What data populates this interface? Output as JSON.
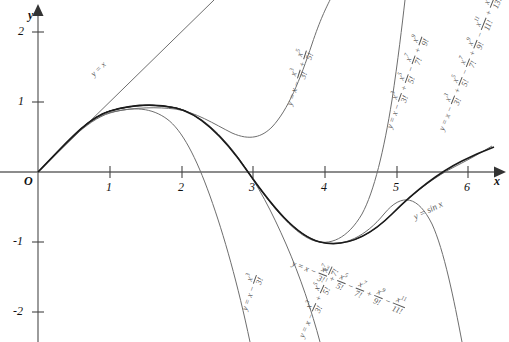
{
  "chart_data": {
    "type": "line",
    "title": "",
    "xlabel": "x",
    "ylabel": "y",
    "xlim": [
      -0.55,
      6.6
    ],
    "ylim": [
      -2.45,
      2.45
    ],
    "xticks": [
      1,
      2,
      3,
      4,
      5,
      6
    ],
    "yticks": [
      2,
      1,
      -1,
      -2
    ],
    "origin_label": "O",
    "grid": false,
    "legend": "inline-curve-labels",
    "series": [
      {
        "name": "y = sin x",
        "label": "y = sin x",
        "color": "#1a1a1a",
        "width": 1.6,
        "expression": "sin(x)",
        "points_x": [
          0,
          0.5,
          1,
          1.5708,
          2,
          2.5,
          3.1416,
          3.5,
          4,
          4.7124,
          5,
          5.5,
          6,
          6.5
        ],
        "points_y": [
          0,
          0.479,
          0.841,
          1,
          0.909,
          0.599,
          0,
          -0.351,
          -0.757,
          -1,
          -0.959,
          -0.706,
          -0.279,
          0.215
        ]
      },
      {
        "name": "T1",
        "label": "y = x",
        "color": "#6e6e6e",
        "width": 1,
        "expression": "x",
        "points_x": [
          0,
          1,
          2,
          2.45
        ],
        "points_y": [
          0,
          1,
          2,
          2.45
        ]
      },
      {
        "name": "T3",
        "label": "y = x - x^3/3!",
        "color": "#6e6e6e",
        "width": 1,
        "expression": "x - x^3/3!",
        "points_x": [
          0,
          0.5,
          1,
          1.5708,
          2,
          2.5,
          3,
          3.3
        ],
        "points_y": [
          0,
          0.479,
          0.833,
          0.925,
          0.667,
          -0.104,
          -1.5,
          -2.69
        ]
      },
      {
        "name": "T5",
        "label": "y = x - x^3/3! + x^5/5!",
        "color": "#6e6e6e",
        "width": 1,
        "expression": "x - x^3/3! + x^5/5!",
        "points_x": [
          0,
          1,
          1.5708,
          2,
          2.5,
          3,
          3.5,
          4,
          4.3
        ],
        "points_y": [
          0,
          0.842,
          1.004,
          0.933,
          0.71,
          0.525,
          1.063,
          3.06,
          5.0
        ]
      },
      {
        "name": "T7",
        "label": "y = x - x^3/3! + x^5/5! - x^7/7!",
        "color": "#6e6e6e",
        "width": 1,
        "expression": "x - x^3/3! + x^5/5! - x^7/7!",
        "points_x": [
          0,
          1,
          1.5708,
          2.5,
          3.1416,
          3.8,
          4.2,
          4.5
        ],
        "points_y": [
          0,
          0.841,
          1.0,
          0.598,
          -0.075,
          -1.2,
          -2.2,
          -3.3
        ]
      },
      {
        "name": "T9",
        "label": "y = x - x^3/3! + x^5/5! - x^7/7! + x^9/9!",
        "color": "#6e6e6e",
        "width": 1,
        "expression": "x - x^3/3! + x^5/5! - x^7/7! + x^9/9!",
        "points_x": [
          0,
          1.5708,
          3.1416,
          4,
          4.7124,
          5,
          5.3
        ],
        "points_y": [
          0,
          1.0,
          0.0,
          -0.757,
          -0.976,
          -0.8,
          0.2
        ]
      },
      {
        "name": "T11",
        "label": "y = x - x^3/3! + x^5/5! - x^7/7! + x^9/9! - x^11/11!",
        "color": "#6e6e6e",
        "width": 1,
        "expression": "x - x^3/3! + x^5/5! - x^7/7! + x^9/9! - x^11/11!",
        "points_x": [
          0,
          1.5708,
          3.1416,
          4.7124,
          5.5,
          6,
          6.3
        ],
        "points_y": [
          0,
          1.0,
          0.0,
          -1.0,
          -0.72,
          -0.6,
          -1.4
        ]
      },
      {
        "name": "T13",
        "label": "y = x - x^3/3! + x^5/5! - x^7/7! + x^9/9! - x^11/11! + x^13/13!",
        "color": "#6e6e6e",
        "width": 1,
        "expression": "x - x^3/3! + x^5/5! - x^7/7! + x^9/9! - x^11/11! + x^13/13!",
        "points_x": [
          0,
          1.5708,
          3.1416,
          4.7124,
          6,
          6.4
        ],
        "points_y": [
          0,
          1.0,
          0.0,
          -1.0,
          -0.28,
          0.6
        ]
      }
    ],
    "annotations": [
      {
        "id": "t1",
        "text": "y = x"
      },
      {
        "id": "t3",
        "text": "y = x - x^3/3!"
      },
      {
        "id": "t5",
        "text": "y = x - x^3/3! + x^5/5!"
      },
      {
        "id": "t7",
        "text": "y = x - x^3/3! + x^5/5! - x^7/7!"
      },
      {
        "id": "t9",
        "text": "y = x - x^3/3! + x^5/5! - x^7/7! + x^9/9!"
      },
      {
        "id": "t11",
        "text": "y = x - x^3/3! + x^5/5! - x^7/7! + x^9/9! - x^11/11!"
      },
      {
        "id": "t13",
        "text": "y = x - x^3/3! + x^5/5! - x^7/7! + x^9/9! - x^11/11! + x^13/13!"
      },
      {
        "id": "sin",
        "text": "y = sin x"
      }
    ]
  },
  "axes": {
    "x_axis_label": "x",
    "y_axis_label": "y",
    "origin": "O",
    "x_ticks": [
      "1",
      "2",
      "3",
      "4",
      "5",
      "6"
    ],
    "y_ticks": [
      "2",
      "1",
      "-1",
      "-2"
    ],
    "axis_color": "#555555",
    "curve_color": "#6e6e6e",
    "sine_color": "#1a1a1a"
  },
  "labels": {
    "sin_prefix": "y = sin",
    "sin_var": "x",
    "eq_lead": "y = x",
    "minus": "−",
    "plus": "+",
    "terms": [
      {
        "num": "x",
        "sup": "3",
        "den": "3!"
      },
      {
        "num": "x",
        "sup": "5",
        "den": "5!"
      },
      {
        "num": "x",
        "sup": "7",
        "den": "7!"
      },
      {
        "num": "x",
        "sup": "9",
        "den": "9!"
      },
      {
        "num": "x",
        "sup": "11",
        "den": "11!"
      },
      {
        "num": "x",
        "sup": "13",
        "den": "13!"
      }
    ]
  }
}
